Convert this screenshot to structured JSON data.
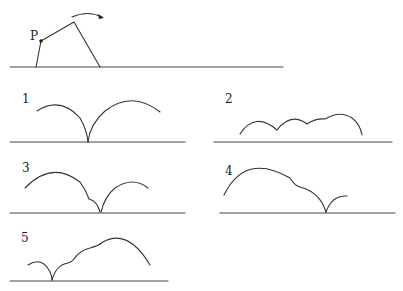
{
  "header": {
    "cropped_text": ""
  },
  "top_figure": {
    "point_label": "P",
    "description": "Pivoting rigid linkage rotating clockwise over ground line; arrow indicates rotation direction"
  },
  "panels": [
    {
      "label": "1",
      "description": "Two arcs meeting at a cusp on the ground; left arc smaller, right arc larger"
    },
    {
      "label": "2",
      "description": "Series of shallow scalloped arcs above ground"
    },
    {
      "label": "3",
      "description": "Large left arc with small notch descending to cusp on ground, then smaller right arc"
    },
    {
      "label": "4",
      "description": "Large left arc with shoulder, descending to cusp on ground, small right arc"
    },
    {
      "label": "5",
      "description": "Small left arc to cusp on ground, then rising stepped arc to large right arc"
    }
  ],
  "colors": {
    "stroke": "#333333",
    "background": "#ffffff"
  }
}
